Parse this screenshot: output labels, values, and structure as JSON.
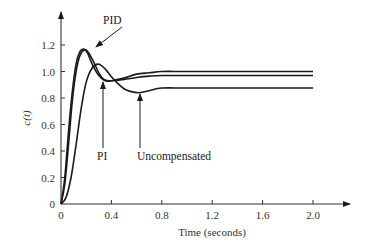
{
  "chart_data": {
    "type": "line",
    "title": "",
    "xlabel": "Time (seconds)",
    "ylabel": "c(t)",
    "xlim": [
      0,
      2.0
    ],
    "ylim": [
      0,
      1.3
    ],
    "xticks": [
      0,
      0.4,
      0.8,
      1.2,
      1.6,
      2.0
    ],
    "xtick_labels": [
      "0",
      "0.4",
      "0.8",
      "1.2",
      "1.6",
      "2.0"
    ],
    "yticks": [
      0,
      0.2,
      0.4,
      0.6,
      0.8,
      1.0,
      1.2
    ],
    "ytick_labels": [
      "0",
      "0.2",
      "0.4",
      "0.6",
      "0.8",
      "1.0",
      "1.2"
    ],
    "grid": false,
    "legend": "none (curves labeled with arrow annotations)",
    "series": [
      {
        "name": "PID",
        "x": [
          0,
          0.03,
          0.06,
          0.09,
          0.12,
          0.15,
          0.18,
          0.21,
          0.25,
          0.3,
          0.35,
          0.4,
          0.5,
          0.6,
          0.7,
          0.8,
          1.0,
          1.4,
          2.0
        ],
        "y": [
          0,
          0.2,
          0.55,
          0.85,
          1.06,
          1.15,
          1.17,
          1.14,
          1.05,
          0.97,
          0.93,
          0.93,
          0.95,
          0.98,
          0.99,
          1.0,
          1.0,
          1.0,
          1.0
        ]
      },
      {
        "name": "PI",
        "x": [
          0,
          0.03,
          0.06,
          0.09,
          0.12,
          0.15,
          0.19,
          0.22,
          0.26,
          0.3,
          0.34,
          0.4,
          0.5,
          0.6,
          0.7,
          0.8,
          1.0,
          1.4,
          2.0
        ],
        "y": [
          0,
          0.15,
          0.45,
          0.78,
          1.0,
          1.12,
          1.165,
          1.14,
          1.07,
          0.99,
          0.94,
          0.93,
          0.94,
          0.955,
          0.965,
          0.97,
          0.97,
          0.97,
          0.97
        ]
      },
      {
        "name": "Uncompensated",
        "x": [
          0,
          0.04,
          0.08,
          0.12,
          0.16,
          0.2,
          0.25,
          0.3,
          0.35,
          0.4,
          0.45,
          0.5,
          0.55,
          0.62,
          0.7,
          0.8,
          1.0,
          1.4,
          2.0
        ],
        "y": [
          0,
          0.05,
          0.2,
          0.45,
          0.72,
          0.92,
          1.03,
          1.055,
          1.02,
          0.96,
          0.91,
          0.87,
          0.85,
          0.84,
          0.855,
          0.875,
          0.875,
          0.875,
          0.875
        ]
      }
    ],
    "annotations": [
      {
        "text": "PID",
        "points_to": [
          0.2,
          1.165
        ]
      },
      {
        "text": "PI",
        "points_to": [
          0.34,
          0.93
        ]
      },
      {
        "text": "Uncompensated",
        "points_to": [
          0.62,
          0.84
        ]
      }
    ]
  },
  "labels": {
    "xlabel": "Time (seconds)",
    "ylabel": "c(t)",
    "pid": "PID",
    "pi": "PI",
    "uncompensated": "Uncompensated"
  }
}
